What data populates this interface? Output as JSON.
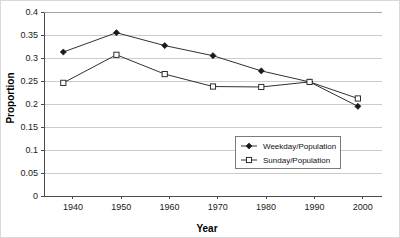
{
  "chart_data": {
    "type": "line",
    "title": "",
    "xlabel": "Year",
    "ylabel": "Proportion",
    "x": [
      1938,
      1949,
      1959,
      1969,
      1979,
      1989,
      1999
    ],
    "xlim": [
      1934,
      2004
    ],
    "ylim": [
      0,
      0.4
    ],
    "xticks": [
      1940,
      1950,
      1960,
      1970,
      1980,
      1990,
      2000
    ],
    "xtick_labels": [
      "1940",
      "1950",
      "1960",
      "1970",
      "1980",
      "1990",
      "2000"
    ],
    "yticks": [
      0,
      0.05,
      0.1,
      0.15,
      0.2,
      0.25,
      0.3,
      0.35,
      0.4
    ],
    "ytick_labels": [
      "0",
      "0.05",
      "0.1",
      "0.15",
      "0.2",
      "0.25",
      "0.3",
      "0.35",
      "0.4"
    ],
    "grid": "horizontal",
    "legend_position": "center-right",
    "series": [
      {
        "name": "Weekday/Population",
        "marker": "filled-diamond",
        "color": "#1a1a1a",
        "values": [
          0.313,
          0.355,
          0.327,
          0.305,
          0.272,
          0.248,
          0.195
        ]
      },
      {
        "name": "Sunday/Population",
        "marker": "open-square",
        "color": "#1a1a1a",
        "values": [
          0.246,
          0.307,
          0.265,
          0.238,
          0.237,
          0.248,
          0.212
        ]
      }
    ]
  },
  "axes": {
    "x_title": "Year",
    "y_title": "Proportion"
  },
  "legend": {
    "entries": [
      {
        "label": "Weekday/Population"
      },
      {
        "label": "Sunday/Population"
      }
    ]
  }
}
